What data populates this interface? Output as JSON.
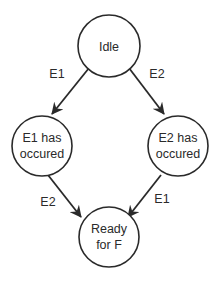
{
  "diagram": {
    "type": "state-machine",
    "colors": {
      "stroke": "#2a2a2a",
      "background": "#ffffff",
      "text": "#2a2a2a"
    },
    "nodes": [
      {
        "id": "idle",
        "line1": "Idle",
        "line2": ""
      },
      {
        "id": "e1",
        "line1": "E1 has",
        "line2": "occured"
      },
      {
        "id": "e2",
        "line1": "E2 has",
        "line2": "occured"
      },
      {
        "id": "ready",
        "line1": "Ready",
        "line2": "for F"
      }
    ],
    "edges": [
      {
        "from": "idle",
        "to": "e1",
        "label": "E1"
      },
      {
        "from": "idle",
        "to": "e2",
        "label": "E2"
      },
      {
        "from": "e1",
        "to": "ready",
        "label": "E2"
      },
      {
        "from": "e2",
        "to": "ready",
        "label": "E1"
      }
    ]
  }
}
